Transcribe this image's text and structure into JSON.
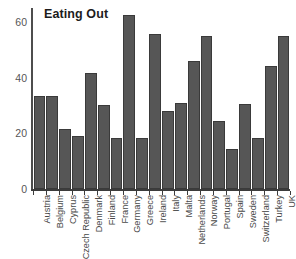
{
  "chart_data": {
    "type": "bar",
    "title": "Eating Out",
    "xlabel": "",
    "ylabel": "",
    "ylim": [
      0,
      65
    ],
    "yticks": [
      0,
      20,
      40,
      60
    ],
    "grid": false,
    "legend": "none",
    "orientation": "vertical",
    "bar_color": "#565656",
    "bar_edge_color": "#3a3a3a",
    "axis_color": "#3c3c3c",
    "background": "#ffffff",
    "categories": [
      "Austria",
      "Belgium",
      "Cyprus",
      "Czech Republic",
      "Denmark",
      "Finland",
      "France",
      "Germany",
      "Greece",
      "Ireland",
      "Italy",
      "Malta",
      "Netherlands",
      "Norway",
      "Portugal",
      "Spain",
      "Sweden",
      "Switzerland",
      "Turkey",
      "UK"
    ],
    "values": [
      33.5,
      33.5,
      21.5,
      19,
      41.5,
      30,
      18.5,
      62.5,
      18.5,
      55.5,
      28,
      31,
      46,
      55,
      24.5,
      14.5,
      30.5,
      18.5,
      44,
      55
    ]
  }
}
